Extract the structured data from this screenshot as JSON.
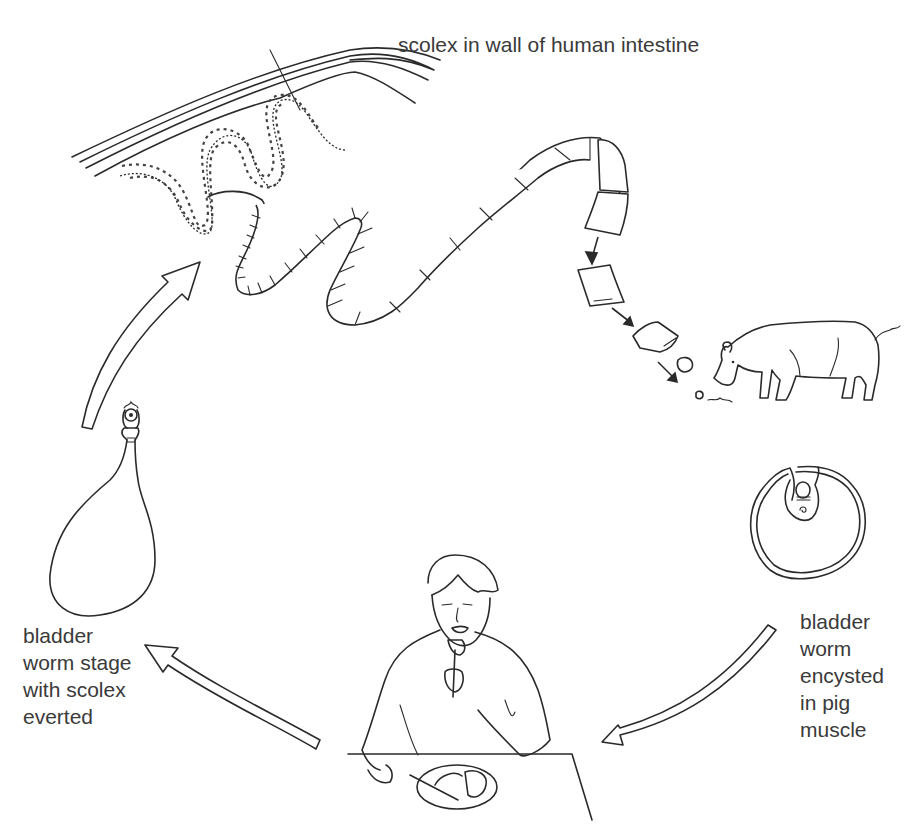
{
  "diagram": {
    "labels": {
      "intestine": "scolex in wall of human intestine",
      "bladder_everted": "bladder\nworm stage\nwith scolex\neverted",
      "bladder_encysted": "bladder\nworm\nencysted\nin pig\nmuscle"
    },
    "stages": [
      {
        "id": "adult-tapeworm",
        "description": "scolex in wall of human intestine"
      },
      {
        "id": "proglottids",
        "description": "gravid segments released and passed"
      },
      {
        "id": "pig",
        "description": "pig eating contaminated material"
      },
      {
        "id": "cyst",
        "description": "bladder worm encysted in pig muscle"
      },
      {
        "id": "human-eating",
        "description": "person eating undercooked pork sausage"
      },
      {
        "id": "bladder-worm",
        "description": "bladder worm stage with scolex everted"
      }
    ],
    "colors": {
      "line": "#2a2a2a",
      "text": "#3a3a3a",
      "background": "#ffffff"
    }
  }
}
